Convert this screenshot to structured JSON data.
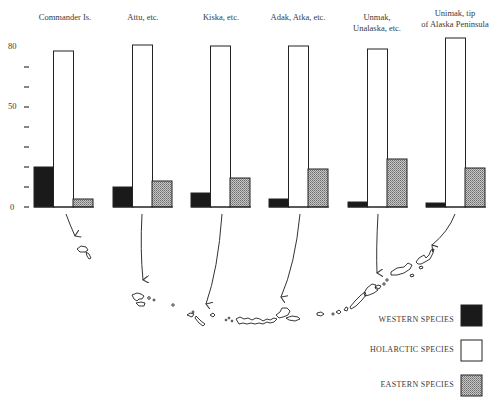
{
  "chart_data": {
    "type": "bar",
    "title": "",
    "xlabel": "",
    "ylabel": "",
    "ylim": [
      0,
      80
    ],
    "yticks": [
      0,
      10,
      20,
      30,
      40,
      50,
      60,
      70,
      80
    ],
    "ytick_labels": [
      "0",
      "",
      "",
      "",
      "",
      "50",
      "",
      "",
      "80"
    ],
    "grid": false,
    "legend_position": "bottom-right",
    "categories": [
      "Commander Is.",
      "Attu, etc.",
      "Kiska, etc.",
      "Adak, Atka, etc.",
      "Unmak, Unalaska, etc.",
      "Unimak, tip of Alaska Peninsula"
    ],
    "category_label_lines": [
      [
        "Commander Is."
      ],
      [
        "Attu, etc."
      ],
      [
        "Kiska, etc."
      ],
      [
        "Adak, Atka, etc."
      ],
      [
        "Unmak,",
        "Unalaska, etc."
      ],
      [
        "Unimak, tip",
        "of Alaska Peninsula"
      ]
    ],
    "series": [
      {
        "name": "WESTERN SPECIES",
        "fill": "#1a1a1a",
        "pattern": "solid",
        "values": [
          20,
          10,
          7,
          4,
          2.5,
          2
        ]
      },
      {
        "name": "HOLARCTIC SPECIES",
        "fill": "#ffffff",
        "pattern": "open",
        "values": [
          78,
          81,
          80.5,
          80.5,
          79,
          84.5
        ]
      },
      {
        "name": "EASTERN SPECIES",
        "fill": "#9a9a9a",
        "pattern": "crosshatch",
        "values": [
          4,
          13,
          14.5,
          19,
          24,
          19.5
        ]
      }
    ],
    "annotations": [
      "Arrows point from each group of bars to the corresponding island group on an outline map of the Aleutian chain below"
    ]
  },
  "axis": {
    "label_0": "0",
    "label_50": "50",
    "label_80": "80"
  },
  "legend": {
    "items": [
      {
        "label": "WESTERN SPECIES",
        "color": "#1a1a1a"
      },
      {
        "label": "HOLARCTIC SPECIES",
        "color": "#ffffff"
      },
      {
        "label": "EASTERN SPECIES",
        "color": "#9a9a9a"
      }
    ]
  },
  "map": {
    "description": "Outline map of Aleutian Islands from Commander Is. (west) to tip of Alaska Peninsula (east)"
  }
}
